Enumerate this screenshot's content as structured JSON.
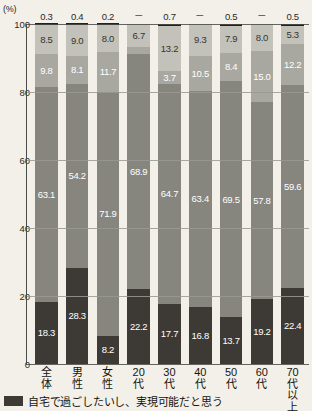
{
  "chart_data": {
    "type": "bar",
    "subtype": "stacked-vertical-100",
    "title": "",
    "xlabel": "",
    "ylabel": "(%)",
    "ylim": [
      0,
      100
    ],
    "yticks": [
      "100",
      "80",
      "60",
      "40",
      "20",
      "0"
    ],
    "ytick_values": [
      100,
      80,
      60,
      40,
      20,
      0
    ],
    "grid": true,
    "legend_position": "bottom-left",
    "categories": [
      "全体",
      "男性",
      "女性",
      "20代",
      "30代",
      "40代",
      "50代",
      "60代",
      "70代以上"
    ],
    "category_lines": [
      [
        "全",
        "体"
      ],
      [
        "男",
        "性"
      ],
      [
        "女",
        "性"
      ],
      [
        "20",
        "代"
      ],
      [
        "30",
        "代"
      ],
      [
        "40",
        "代"
      ],
      [
        "50",
        "代"
      ],
      [
        "60",
        "代"
      ],
      [
        "70",
        "代",
        "以",
        "上"
      ]
    ],
    "series": [
      {
        "name": "自宅で過ごしたいし、実現可能だと思う",
        "color": "#3d3a36",
        "values": [
          18.3,
          28.3,
          8.2,
          22.2,
          17.7,
          16.8,
          13.7,
          19.2,
          22.4
        ],
        "labels": [
          "18.3",
          "28.3",
          "8.2",
          "22.2",
          "17.7",
          "16.8",
          "13.7",
          "19.2",
          "22.4"
        ]
      },
      {
        "name": "series-2",
        "color": "#86867f",
        "values": [
          63.1,
          54.2,
          71.9,
          68.9,
          64.7,
          63.4,
          69.5,
          57.8,
          59.6
        ],
        "labels": [
          "63.1",
          "54.2",
          "71.9",
          "68.9",
          "64.7",
          "63.4",
          "69.5",
          "57.8",
          "59.6"
        ]
      },
      {
        "name": "series-3",
        "color": "#a8a7a0",
        "values": [
          9.8,
          8.1,
          11.7,
          2.2,
          3.7,
          10.5,
          8.4,
          15.0,
          12.2
        ],
        "labels": [
          "9.8",
          "8.1",
          "11.7",
          "2.2",
          "3.7",
          "10.5",
          "8.4",
          "15.0",
          "12.2"
        ]
      },
      {
        "name": "series-4",
        "color": "#d8d6cd",
        "values": [
          8.5,
          9.0,
          8.0,
          6.7,
          13.2,
          9.3,
          7.9,
          8.0,
          5.3
        ],
        "labels": [
          "8.5",
          "9.0",
          "8.0",
          "6.7",
          "13.2",
          "9.3",
          "7.9",
          "8.0",
          "5.3"
        ]
      },
      {
        "name": "series-5-top",
        "color": "#23211e",
        "values": [
          0.3,
          0.4,
          0.2,
          0.0,
          0.7,
          0.0,
          0.5,
          0.0,
          0.5
        ],
        "labels": [
          "0.3",
          "0.4",
          "0.2",
          "－",
          "0.7",
          "－",
          "0.5",
          "－",
          "0.5"
        ]
      }
    ]
  },
  "legend": {
    "items": [
      {
        "label": "自宅で過ごしたいし、実現可能だと思う",
        "color": "#3d3a36"
      }
    ]
  }
}
